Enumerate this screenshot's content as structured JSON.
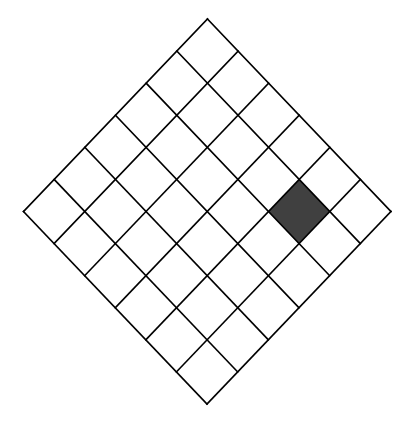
{
  "diagram": {
    "type": "rotated-square-grid",
    "rows": 6,
    "cols": 6,
    "vertices": {
      "top": [
        207.5,
        19
      ],
      "right": [
        391,
        211.5
      ],
      "bottom": [
        207.5,
        404
      ],
      "left": [
        23.5,
        211.5
      ]
    },
    "line_color": "#000000",
    "line_width": 1.6,
    "background": "#ffffff",
    "cell_fill": "#ffffff",
    "shaded_cells": [
      {
        "u": 4,
        "v": 1,
        "fill": "#404040"
      }
    ]
  }
}
